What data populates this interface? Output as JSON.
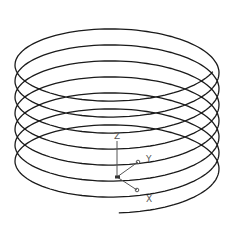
{
  "view": {
    "width": 233,
    "height": 234,
    "background": "#ffffff"
  },
  "helix": {
    "center_x": 117,
    "radius_x": 102,
    "radius_y": 40,
    "top_y": 13,
    "pitch": 16,
    "start_angle_deg": 20,
    "end_angle_deg": 2610,
    "stroke": "#1a1a1a",
    "stroke_width": 1.3
  },
  "ucs_icon": {
    "origin": [
      117,
      177
    ],
    "axes": {
      "z": {
        "label": "Z",
        "tip": [
          117,
          141
        ],
        "label_pos": [
          114,
          139
        ]
      },
      "y": {
        "label": "Y",
        "tip": [
          138,
          162
        ],
        "label_pos": [
          146,
          162
        ]
      },
      "x": {
        "label": "X",
        "tip": [
          137,
          190
        ],
        "label_pos": [
          146,
          202
        ]
      }
    },
    "color": "#555555"
  }
}
